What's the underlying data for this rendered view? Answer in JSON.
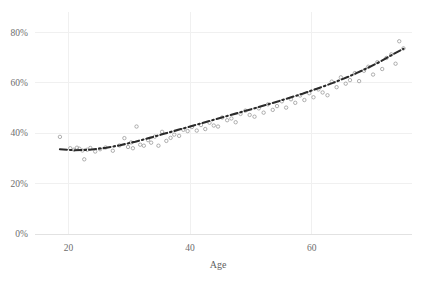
{
  "chart_data": {
    "type": "scatter",
    "title": "",
    "subtitle": "",
    "xlabel": "Age",
    "ylabel": "",
    "xlim": [
      14.5,
      76.5
    ],
    "ylim": [
      0,
      88
    ],
    "grid": true,
    "legend": null,
    "x_ticks": [
      20,
      40,
      60
    ],
    "x_tick_labels": [
      "20",
      "40",
      "60"
    ],
    "y_ticks": [
      0,
      20,
      40,
      60,
      80
    ],
    "y_tick_labels": [
      "0%",
      "20%",
      "40%",
      "60%",
      "80%"
    ],
    "point_color": "#9b9b9b",
    "line_color": "#2b2b2b",
    "grid_color": "#f0f0f0",
    "series": [
      {
        "name": "observations",
        "marker": "open-circle",
        "x": [
          18.6,
          20.3,
          20.9,
          21.4,
          21.8,
          22.3,
          22.6,
          23.1,
          23.6,
          24.4,
          25.2,
          26.1,
          27.3,
          28.4,
          29.2,
          29.8,
          30.3,
          30.6,
          31.2,
          31.8,
          32.4,
          33.1,
          33.6,
          34.2,
          34.8,
          35.4,
          36.1,
          36.8,
          37.4,
          38.2,
          38.9,
          39.6,
          40.3,
          41.1,
          41.8,
          42.5,
          43.2,
          43.9,
          44.6,
          45.3,
          46.1,
          46.8,
          47.5,
          48.3,
          49.1,
          49.8,
          50.6,
          51.3,
          52.1,
          52.8,
          53.6,
          54.3,
          55.1,
          55.8,
          56.6,
          57.3,
          58.1,
          58.8,
          59.6,
          60.3,
          61.1,
          61.8,
          62.6,
          63.3,
          64.1,
          64.8,
          65.6,
          66.3,
          67.1,
          67.8,
          68.6,
          69.3,
          70.1,
          70.8,
          71.6,
          72.3,
          73.1,
          73.8,
          74.4,
          75.1
        ],
        "y": [
          38.5,
          34.0,
          33.4,
          34.2,
          33.8,
          33.1,
          29.6,
          33.4,
          34.1,
          32.7,
          33.6,
          34.3,
          33.0,
          35.1,
          38.0,
          34.5,
          36.3,
          34.0,
          42.6,
          35.4,
          35.0,
          37.2,
          36.2,
          38.6,
          35.0,
          40.5,
          36.9,
          38.1,
          39.4,
          38.9,
          41.3,
          40.8,
          42.4,
          41.0,
          43.2,
          41.6,
          44.1,
          43.0,
          42.6,
          46.2,
          45.1,
          45.8,
          44.3,
          47.6,
          48.9,
          47.2,
          46.5,
          49.8,
          48.1,
          51.4,
          49.2,
          50.7,
          52.6,
          50.1,
          53.4,
          52.0,
          54.9,
          53.1,
          55.8,
          54.2,
          57.3,
          56.1,
          55.0,
          60.4,
          58.2,
          62.1,
          59.6,
          61.0,
          63.8,
          60.6,
          64.7,
          66.3,
          63.2,
          68.1,
          65.4,
          69.8,
          71.2,
          67.5,
          76.4,
          73.6
        ]
      }
    ],
    "trend": {
      "name": "smoothed-fit",
      "style": "dash-dot",
      "x": [
        18.6,
        21.0,
        23.5,
        26.0,
        28.5,
        31.0,
        33.5,
        36.0,
        38.5,
        41.0,
        43.5,
        46.0,
        48.5,
        51.0,
        53.5,
        56.0,
        58.5,
        61.0,
        63.5,
        66.0,
        68.5,
        71.0,
        73.5,
        75.1
      ],
      "y": [
        33.6,
        33.2,
        33.4,
        34.1,
        35.2,
        36.6,
        38.2,
        39.9,
        41.6,
        43.3,
        45.0,
        46.7,
        48.4,
        50.1,
        51.9,
        53.7,
        55.6,
        57.7,
        59.9,
        62.3,
        65.0,
        68.0,
        71.4,
        73.4
      ]
    }
  },
  "axes": {
    "x_title": "Age"
  }
}
